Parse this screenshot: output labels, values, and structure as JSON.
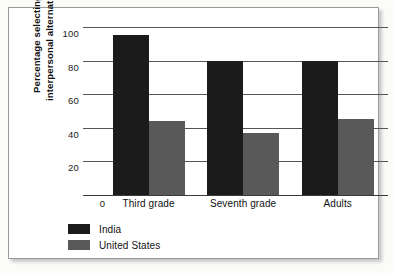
{
  "chart_data": {
    "type": "bar",
    "title": "",
    "xlabel": "",
    "ylabel": "Percentage selecting interpersonal alternative",
    "ylabel_lines": [
      "Percentage selecting",
      "interpersonal alternative"
    ],
    "categories": [
      "Third grade",
      "Seventh grade",
      "Adults"
    ],
    "series": [
      {
        "name": "India",
        "color": "#1b1b1b",
        "values": [
          95,
          80,
          80
        ]
      },
      {
        "name": "United States",
        "color": "#595959",
        "values": [
          44,
          37,
          45
        ]
      }
    ],
    "ylim": [
      0,
      100
    ],
    "yticks": [
      0,
      20,
      40,
      60,
      80,
      100
    ],
    "ytick_labels": [
      "0",
      "20",
      "40",
      "60",
      "80",
      "100"
    ],
    "grid": true,
    "legend_position": "bottom-left"
  },
  "legend": {
    "items": [
      {
        "label": "India",
        "color": "#1b1b1b"
      },
      {
        "label": "United States",
        "color": "#595959"
      }
    ]
  }
}
